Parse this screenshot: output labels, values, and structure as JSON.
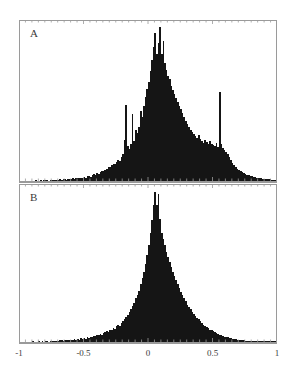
{
  "figure": {
    "background_color": "#ffffff",
    "frame_color": "#9a9a9a",
    "bar_color": "#151515",
    "width": 296,
    "height": 377
  },
  "panels": [
    {
      "id": "panel-a",
      "label": "A",
      "x": 19,
      "y": 20,
      "width": 258,
      "height": 163
    },
    {
      "id": "panel-b",
      "label": "B",
      "x": 19,
      "y": 184,
      "width": 258,
      "height": 160
    }
  ],
  "axis": {
    "tick_labels": [
      "-1",
      "-0.5",
      "0",
      "0.5",
      "1"
    ],
    "tick_values": [
      -1,
      -0.5,
      0,
      0.5,
      1
    ],
    "xmin": -1,
    "xmax": 1,
    "label_y": 348
  },
  "chart_data": [
    {
      "type": "bar",
      "title": "A",
      "xlabel": "",
      "ylabel": "",
      "xlim": [
        -1,
        1
      ],
      "ylim": [
        0,
        1
      ],
      "grid": false,
      "legend": "none",
      "bin_width": 0.0125,
      "x": [
        -1.0,
        -0.9875,
        -0.975,
        -0.9625,
        -0.95,
        -0.9375,
        -0.925,
        -0.9125,
        -0.9,
        -0.8875,
        -0.875,
        -0.8625,
        -0.85,
        -0.8375,
        -0.825,
        -0.8125,
        -0.8,
        -0.7875,
        -0.775,
        -0.7625,
        -0.75,
        -0.7375,
        -0.725,
        -0.7125,
        -0.7,
        -0.6875,
        -0.675,
        -0.6625,
        -0.65,
        -0.6375,
        -0.625,
        -0.6125,
        -0.6,
        -0.5875,
        -0.575,
        -0.5625,
        -0.55,
        -0.5375,
        -0.525,
        -0.5125,
        -0.5,
        -0.4875,
        -0.475,
        -0.4625,
        -0.45,
        -0.4375,
        -0.425,
        -0.4125,
        -0.4,
        -0.3875,
        -0.375,
        -0.3625,
        -0.35,
        -0.3375,
        -0.325,
        -0.3125,
        -0.3,
        -0.2875,
        -0.275,
        -0.2625,
        -0.25,
        -0.2375,
        -0.225,
        -0.2125,
        -0.2,
        -0.1875,
        -0.175,
        -0.1625,
        -0.15,
        -0.1375,
        -0.125,
        -0.1125,
        -0.1,
        -0.0875,
        -0.075,
        -0.0625,
        -0.05,
        -0.0375,
        -0.025,
        -0.0125,
        0.0,
        0.0125,
        0.025,
        0.0375,
        0.05,
        0.0625,
        0.075,
        0.0875,
        0.1,
        0.1125,
        0.125,
        0.1375,
        0.15,
        0.1625,
        0.175,
        0.1875,
        0.2,
        0.2125,
        0.225,
        0.2375,
        0.25,
        0.2625,
        0.275,
        0.2875,
        0.3,
        0.3125,
        0.325,
        0.3375,
        0.35,
        0.3625,
        0.375,
        0.3875,
        0.4,
        0.4125,
        0.425,
        0.4375,
        0.45,
        0.4625,
        0.475,
        0.4875,
        0.5,
        0.5125,
        0.525,
        0.5375,
        0.55,
        0.5625,
        0.575,
        0.5875,
        0.6,
        0.6125,
        0.625,
        0.6375,
        0.65,
        0.6625,
        0.675,
        0.6875,
        0.7,
        0.7125,
        0.725,
        0.7375,
        0.75,
        0.7625,
        0.775,
        0.7875,
        0.8,
        0.8125,
        0.825,
        0.8375,
        0.85,
        0.8625,
        0.875,
        0.8875,
        0.9,
        0.9125,
        0.925,
        0.9375,
        0.95,
        0.9625,
        0.975,
        0.9875
      ],
      "values": [
        0.0,
        0.0,
        0.0,
        0.0,
        0.0,
        0.0,
        0.0,
        0.0,
        0.0,
        0.0,
        0.004,
        0.0,
        0.0,
        0.004,
        0.0,
        0.004,
        0.006,
        0.004,
        0.0,
        0.004,
        0.006,
        0.004,
        0.008,
        0.004,
        0.006,
        0.01,
        0.006,
        0.01,
        0.012,
        0.008,
        0.01,
        0.014,
        0.012,
        0.016,
        0.012,
        0.018,
        0.02,
        0.016,
        0.022,
        0.02,
        0.026,
        0.022,
        0.03,
        0.034,
        0.028,
        0.038,
        0.042,
        0.036,
        0.05,
        0.046,
        0.058,
        0.064,
        0.06,
        0.072,
        0.078,
        0.09,
        0.086,
        0.098,
        0.11,
        0.104,
        0.118,
        0.13,
        0.126,
        0.148,
        0.17,
        0.255,
        0.48,
        0.22,
        0.2,
        0.23,
        0.42,
        0.25,
        0.32,
        0.3,
        0.34,
        0.44,
        0.4,
        0.47,
        0.53,
        0.58,
        0.62,
        0.69,
        0.76,
        0.84,
        0.93,
        0.8,
        0.87,
        0.97,
        0.8,
        0.88,
        0.74,
        0.7,
        0.66,
        0.64,
        0.6,
        0.575,
        0.55,
        0.52,
        0.5,
        0.47,
        0.45,
        0.43,
        0.4,
        0.38,
        0.36,
        0.34,
        0.32,
        0.31,
        0.295,
        0.28,
        0.27,
        0.29,
        0.265,
        0.25,
        0.24,
        0.26,
        0.245,
        0.235,
        0.25,
        0.23,
        0.225,
        0.22,
        0.24,
        0.215,
        0.56,
        0.23,
        0.205,
        0.195,
        0.185,
        0.17,
        0.15,
        0.13,
        0.115,
        0.1,
        0.088,
        0.076,
        0.068,
        0.06,
        0.054,
        0.048,
        0.044,
        0.038,
        0.036,
        0.032,
        0.03,
        0.026,
        0.026,
        0.022,
        0.02,
        0.018,
        0.016,
        0.014,
        0.014,
        0.012,
        0.01,
        0.01,
        0.008,
        0.006,
        0.004,
        0.004
      ]
    },
    {
      "type": "bar",
      "title": "B",
      "xlabel": "",
      "ylabel": "",
      "xlim": [
        -1,
        1
      ],
      "ylim": [
        0,
        1
      ],
      "grid": false,
      "legend": "none",
      "bin_width": 0.0125,
      "x": [
        -1.0,
        -0.9875,
        -0.975,
        -0.9625,
        -0.95,
        -0.9375,
        -0.925,
        -0.9125,
        -0.9,
        -0.8875,
        -0.875,
        -0.8625,
        -0.85,
        -0.8375,
        -0.825,
        -0.8125,
        -0.8,
        -0.7875,
        -0.775,
        -0.7625,
        -0.75,
        -0.7375,
        -0.725,
        -0.7125,
        -0.7,
        -0.6875,
        -0.675,
        -0.6625,
        -0.65,
        -0.6375,
        -0.625,
        -0.6125,
        -0.6,
        -0.5875,
        -0.575,
        -0.5625,
        -0.55,
        -0.5375,
        -0.525,
        -0.5125,
        -0.5,
        -0.4875,
        -0.475,
        -0.4625,
        -0.45,
        -0.4375,
        -0.425,
        -0.4125,
        -0.4,
        -0.3875,
        -0.375,
        -0.3625,
        -0.35,
        -0.3375,
        -0.325,
        -0.3125,
        -0.3,
        -0.2875,
        -0.275,
        -0.2625,
        -0.25,
        -0.2375,
        -0.225,
        -0.2125,
        -0.2,
        -0.1875,
        -0.175,
        -0.1625,
        -0.15,
        -0.1375,
        -0.125,
        -0.1125,
        -0.1,
        -0.0875,
        -0.075,
        -0.0625,
        -0.05,
        -0.0375,
        -0.025,
        -0.0125,
        0.0,
        0.0125,
        0.025,
        0.0375,
        0.05,
        0.0625,
        0.075,
        0.0875,
        0.1,
        0.1125,
        0.125,
        0.1375,
        0.15,
        0.1625,
        0.175,
        0.1875,
        0.2,
        0.2125,
        0.225,
        0.2375,
        0.25,
        0.2625,
        0.275,
        0.2875,
        0.3,
        0.3125,
        0.325,
        0.3375,
        0.35,
        0.3625,
        0.375,
        0.3875,
        0.4,
        0.4125,
        0.425,
        0.4375,
        0.45,
        0.4625,
        0.475,
        0.4875,
        0.5,
        0.5125,
        0.525,
        0.5375,
        0.55,
        0.5625,
        0.575,
        0.5875,
        0.6,
        0.6125,
        0.625,
        0.6375,
        0.65,
        0.6625,
        0.675,
        0.6875,
        0.7,
        0.7125,
        0.725,
        0.7375,
        0.75,
        0.7625,
        0.775,
        0.7875,
        0.8,
        0.8125,
        0.825,
        0.8375,
        0.85,
        0.8625,
        0.875,
        0.8875,
        0.9,
        0.9125,
        0.925,
        0.9375,
        0.95,
        0.9625,
        0.975,
        0.9875
      ],
      "values": [
        0.0,
        0.0,
        0.0,
        0.0,
        0.0,
        0.0,
        0.0,
        0.0,
        0.004,
        0.0,
        0.0,
        0.0,
        0.004,
        0.0,
        0.004,
        0.0,
        0.006,
        0.004,
        0.0,
        0.004,
        0.006,
        0.004,
        0.006,
        0.008,
        0.004,
        0.01,
        0.012,
        0.008,
        0.01,
        0.014,
        0.01,
        0.012,
        0.016,
        0.012,
        0.018,
        0.014,
        0.02,
        0.016,
        0.024,
        0.02,
        0.026,
        0.022,
        0.03,
        0.026,
        0.034,
        0.03,
        0.04,
        0.036,
        0.046,
        0.042,
        0.052,
        0.048,
        0.058,
        0.064,
        0.07,
        0.066,
        0.08,
        0.076,
        0.09,
        0.086,
        0.1,
        0.11,
        0.105,
        0.125,
        0.135,
        0.15,
        0.16,
        0.175,
        0.19,
        0.21,
        0.23,
        0.25,
        0.28,
        0.3,
        0.33,
        0.37,
        0.41,
        0.45,
        0.5,
        0.56,
        0.62,
        0.7,
        0.78,
        0.88,
        0.96,
        0.88,
        0.95,
        0.79,
        0.7,
        0.66,
        0.62,
        0.58,
        0.545,
        0.51,
        0.48,
        0.45,
        0.42,
        0.395,
        0.37,
        0.345,
        0.32,
        0.3,
        0.28,
        0.26,
        0.24,
        0.225,
        0.21,
        0.195,
        0.18,
        0.168,
        0.155,
        0.145,
        0.132,
        0.122,
        0.112,
        0.104,
        0.095,
        0.088,
        0.08,
        0.074,
        0.068,
        0.062,
        0.056,
        0.052,
        0.047,
        0.043,
        0.039,
        0.035,
        0.032,
        0.029,
        0.026,
        0.024,
        0.021,
        0.019,
        0.017,
        0.015,
        0.014,
        0.012,
        0.011,
        0.01,
        0.009,
        0.008,
        0.008,
        0.007,
        0.006,
        0.006,
        0.005,
        0.005,
        0.004,
        0.004,
        0.004,
        0.003,
        0.003,
        0.003,
        0.002,
        0.002,
        0.002,
        0.002,
        0.001,
        0.001
      ]
    }
  ]
}
